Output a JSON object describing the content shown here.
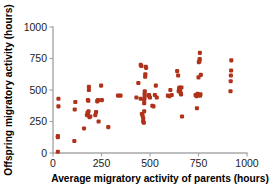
{
  "chart_data": {
    "type": "scatter",
    "title": "",
    "xlabel": "Average migratory activity of parents (hours)",
    "ylabel": "Offspring migratory activity (hours)",
    "xlim": [
      0,
      1000
    ],
    "ylim": [
      0,
      1000
    ],
    "xticks": [
      0,
      250,
      500,
      750,
      1000
    ],
    "yticks": [
      0,
      250,
      500,
      750,
      1000
    ],
    "xtick_labels": [
      "0",
      "250",
      "500",
      "750",
      "1000"
    ],
    "ytick_labels": [
      "0",
      "250",
      "500",
      "750",
      "1000"
    ],
    "grid": false,
    "legend": null,
    "marker_color": "#b0321a",
    "marker_size": 3.0,
    "axis_color": "#a8a8a8",
    "series": [
      {
        "name": "offspring vs parents",
        "points": [
          [
            25,
            10
          ],
          [
            25,
            135
          ],
          [
            25,
            125
          ],
          [
            28,
            370
          ],
          [
            28,
            430
          ],
          [
            110,
            95
          ],
          [
            112,
            345
          ],
          [
            115,
            405
          ],
          [
            160,
            195
          ],
          [
            175,
            300
          ],
          [
            178,
            320
          ],
          [
            180,
            310
          ],
          [
            180,
            420
          ],
          [
            182,
            415
          ],
          [
            183,
            330
          ],
          [
            185,
            500
          ],
          [
            185,
            525
          ],
          [
            188,
            285
          ],
          [
            192,
            290
          ],
          [
            218,
            300
          ],
          [
            222,
            325
          ],
          [
            228,
            410
          ],
          [
            230,
            415
          ],
          [
            232,
            420
          ],
          [
            235,
            250
          ],
          [
            248,
            535
          ],
          [
            252,
            420
          ],
          [
            285,
            205
          ],
          [
            335,
            455
          ],
          [
            348,
            455
          ],
          [
            430,
            440
          ],
          [
            440,
            555
          ],
          [
            452,
            430
          ],
          [
            458,
            310
          ],
          [
            462,
            295
          ],
          [
            465,
            250
          ],
          [
            465,
            275
          ],
          [
            468,
            240
          ],
          [
            470,
            330
          ],
          [
            470,
            395
          ],
          [
            470,
            420
          ],
          [
            472,
            440
          ],
          [
            472,
            465
          ],
          [
            473,
            490
          ],
          [
            475,
            605
          ],
          [
            476,
            625
          ],
          [
            478,
            685
          ],
          [
            480,
            675
          ],
          [
            452,
            700
          ],
          [
            455,
            690
          ],
          [
            492,
            455
          ],
          [
            495,
            460
          ],
          [
            500,
            440
          ],
          [
            512,
            375
          ],
          [
            518,
            370
          ],
          [
            525,
            460
          ],
          [
            530,
            535
          ],
          [
            535,
            440
          ],
          [
            592,
            455
          ],
          [
            600,
            450
          ],
          [
            605,
            500
          ],
          [
            612,
            460
          ],
          [
            640,
            650
          ],
          [
            645,
            615
          ],
          [
            648,
            490
          ],
          [
            650,
            510
          ],
          [
            652,
            520
          ],
          [
            655,
            500
          ],
          [
            658,
            475
          ],
          [
            660,
            465
          ],
          [
            662,
            520
          ],
          [
            665,
            290
          ],
          [
            735,
            460
          ],
          [
            740,
            450
          ],
          [
            742,
            355
          ],
          [
            745,
            470
          ],
          [
            748,
            460
          ],
          [
            750,
            600
          ],
          [
            752,
            720
          ],
          [
            755,
            730
          ],
          [
            756,
            745
          ],
          [
            757,
            795
          ],
          [
            758,
            455
          ],
          [
            760,
            465
          ],
          [
            762,
            620
          ],
          [
            915,
            490
          ],
          [
            916,
            570
          ],
          [
            917,
            615
          ],
          [
            918,
            655
          ],
          [
            919,
            735
          ]
        ]
      }
    ]
  }
}
